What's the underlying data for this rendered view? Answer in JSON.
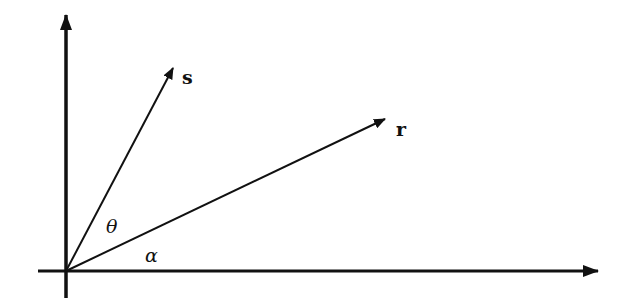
{
  "diagram": {
    "type": "vector-angle-diagram",
    "origin": {
      "x": 66,
      "y": 271
    },
    "colors": {
      "stroke": "#111111",
      "background": "#ffffff"
    },
    "axes": {
      "x_axis": {
        "from": [
          38,
          271
        ],
        "to": [
          598,
          271
        ],
        "label": ""
      },
      "y_axis": {
        "from": [
          66,
          298
        ],
        "to": [
          66,
          15
        ],
        "label": ""
      }
    },
    "vectors": [
      {
        "id": "s",
        "label": "s",
        "tip": [
          173,
          68
        ],
        "label_pos": [
          182,
          84
        ]
      },
      {
        "id": "r",
        "label": "r",
        "tip": [
          385,
          119
        ],
        "label_pos": [
          396,
          136
        ]
      }
    ],
    "angles": [
      {
        "id": "theta",
        "label": "θ",
        "between": [
          "s",
          "r"
        ],
        "label_pos": [
          106,
          233
        ]
      },
      {
        "id": "alpha",
        "label": "α",
        "between": [
          "x_axis",
          "r"
        ],
        "label_pos": [
          145,
          262
        ]
      }
    ]
  }
}
